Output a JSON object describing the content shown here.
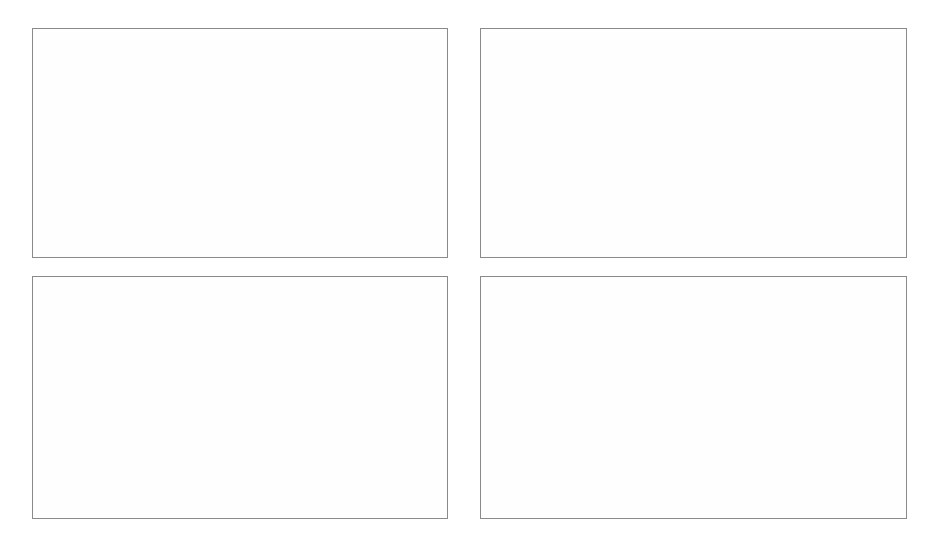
{
  "figure": {
    "panels": [
      "a",
      "b",
      "c",
      "d"
    ],
    "line_color": "#58585a",
    "grid_color": "#9a9a9a",
    "axis_color": "#2b2b2b",
    "background": "#ffffff"
  },
  "chart_data": [
    {
      "panel": "a",
      "type": "line",
      "title": "",
      "xlabel": "Year",
      "ylabel": "Water withdrawal [km³ y⁻¹]",
      "ylabel_parts": {
        "pre": "Water withdrawal [km",
        "sup1": "3",
        "mid": " y",
        "sup2": "-1",
        "post": "]"
      },
      "xlim": [
        1900,
        2000
      ],
      "ylim": [
        0,
        6000
      ],
      "xticks": [
        1900,
        1920,
        1940,
        1960,
        1980,
        2000
      ],
      "xtick_labels": [
        "1900",
        "1920",
        "1940",
        "1960",
        "1980",
        "2000"
      ],
      "yticks": [
        0,
        1000,
        2000,
        3000,
        4000,
        5000,
        6000
      ],
      "ytick_labels": [
        "0",
        "1000",
        "2000",
        "3000",
        "4000",
        "5000",
        "6000"
      ],
      "grid": true,
      "x": [
        1900,
        1940,
        1960,
        1980,
        2000
      ],
      "values": [
        550,
        1030,
        1950,
        3350,
        5200
      ]
    },
    {
      "panel": "b",
      "type": "line",
      "title": "",
      "xlabel": "Year",
      "ylabel": "Large dams [n]",
      "ylabel_parts": {
        "pre": "Large dams [n]",
        "sup1": "",
        "mid": "",
        "sup2": "",
        "post": ""
      },
      "xlim": [
        1900,
        2000
      ],
      "ylim": [
        0,
        35000
      ],
      "xticks": [
        1900,
        1920,
        1940,
        1960,
        1980,
        2000
      ],
      "xtick_labels": [
        "1900",
        "1920",
        "1940",
        "1960",
        "1980",
        "2000"
      ],
      "yticks": [
        0,
        5000,
        10000,
        15000,
        20000,
        25000,
        30000,
        35000
      ],
      "ytick_labels": [
        "0",
        "5000",
        "10000",
        "15000",
        "20000",
        "25000",
        "30000",
        "35000"
      ],
      "grid": true,
      "x": [
        1900,
        1940,
        1960,
        1975,
        1980,
        2000
      ],
      "values": [
        400,
        4000,
        8500,
        18500,
        22000,
        30800
      ]
    },
    {
      "panel": "c",
      "type": "line",
      "title": "",
      "xlabel": "Year",
      "ylabel": "Fisheries landings [MMT y⁻¹]",
      "ylabel_parts": {
        "pre": "Fisheries landings [MMT y",
        "sup1": "",
        "mid": "",
        "sup2": "-1",
        "post": "]"
      },
      "xlim": [
        1900,
        2000
      ],
      "ylim": [
        0,
        10
      ],
      "xticks": [
        1900,
        1920,
        1940,
        1960,
        1980,
        2000
      ],
      "xtick_labels": [
        "1900",
        "1920",
        "1940",
        "1960",
        "1980",
        "2000"
      ],
      "yticks": [
        0,
        2,
        4,
        6,
        8,
        10
      ],
      "ytick_labels": [
        "0",
        "2",
        "4",
        "6",
        "8",
        "10"
      ],
      "grid": true,
      "x": [
        1950,
        1960,
        1970,
        1990,
        2000
      ],
      "values": [
        1.9,
        2.85,
        4.8,
        6.1,
        8.6
      ]
    },
    {
      "panel": "d",
      "type": "line",
      "title": "",
      "xlabel": "Year",
      "ylabel": "N fixation [Tg y⁻¹]",
      "ylabel_parts": {
        "pre": "N fixation [Tg y",
        "sup1": "",
        "mid": "",
        "sup2": "-1",
        "post": "]"
      },
      "xlim": [
        1900,
        2000
      ],
      "ylim": [
        0,
        200
      ],
      "xticks": [
        1900,
        1920,
        1940,
        1960,
        1980,
        2000
      ],
      "xtick_labels": [
        "1900",
        "1920",
        "1940",
        "1960",
        "1980",
        "2000"
      ],
      "yticks": [
        0,
        50,
        100,
        150,
        200
      ],
      "ytick_labels": [
        "0",
        "50",
        "100",
        "150",
        "200"
      ],
      "grid": true,
      "x": [
        1900,
        1940,
        1960,
        1980,
        2000
      ],
      "values": [
        18,
        24,
        45,
        105,
        170
      ]
    }
  ]
}
